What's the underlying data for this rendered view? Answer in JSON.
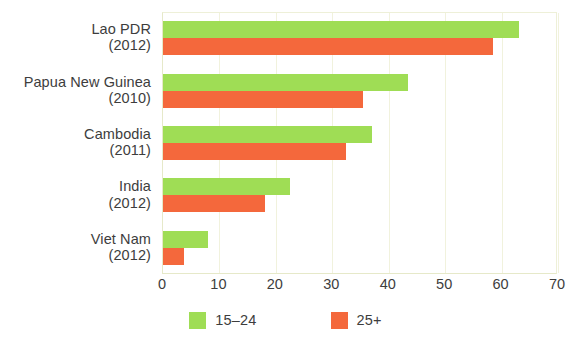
{
  "chart_data": {
    "type": "bar",
    "orientation": "horizontal",
    "title": "",
    "subtitle": "",
    "xlabel": "",
    "ylabel": "",
    "xlim": [
      0,
      70
    ],
    "xticks": [
      0,
      10,
      20,
      30,
      40,
      50,
      60,
      70
    ],
    "xtick_labels": [
      "0",
      "10",
      "20",
      "30",
      "40",
      "50",
      "60",
      "70"
    ],
    "grid": true,
    "grid_axis": "x",
    "legend_position": "bottom-center",
    "categories": [
      "Lao PDR\n(2012)",
      "Papua New Guinea\n(2010)",
      "Cambodia\n(2011)",
      "India\n(2012)",
      "Viet Nam\n(2012)"
    ],
    "category_rows": [
      {
        "name": "Lao PDR",
        "year": "(2012)"
      },
      {
        "name": "Papua New Guinea",
        "year": "(2010)"
      },
      {
        "name": "Cambodia",
        "year": "(2011)"
      },
      {
        "name": "India",
        "year": "(2012)"
      },
      {
        "name": "Viet Nam",
        "year": "(2012)"
      }
    ],
    "series": [
      {
        "name": "15–24",
        "color": "#9FDD55",
        "values": [
          63,
          43.5,
          37,
          22.5,
          8
        ]
      },
      {
        "name": "25+",
        "color": "#F4683C",
        "values": [
          58.5,
          35.5,
          32.5,
          18,
          3.7
        ]
      }
    ]
  },
  "legend": {
    "items": [
      {
        "label": "15–24",
        "color": "#9FDD55"
      },
      {
        "label": "25+",
        "color": "#F4683C"
      }
    ]
  },
  "colors": {
    "series_young": "#9FDD55",
    "series_older": "#F4683C",
    "gridline": "#F1F2DD",
    "axis": "#E6E9C9",
    "text": "#3D3D3D",
    "background": "#FFFFFF"
  }
}
